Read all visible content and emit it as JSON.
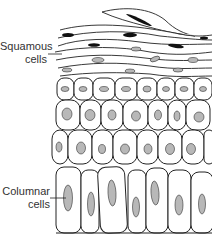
{
  "diagram": {
    "labels": [
      {
        "id": "squamous",
        "line1": "Squamous",
        "line2": "cells"
      },
      {
        "id": "columnar",
        "line1": "Columnar",
        "line2": "cells"
      }
    ],
    "colors": {
      "outline": "#222222",
      "nucleus_fill": "#b8b8b8",
      "squamous_nucleus": "#111111",
      "cell_fill": "#ffffff"
    }
  }
}
